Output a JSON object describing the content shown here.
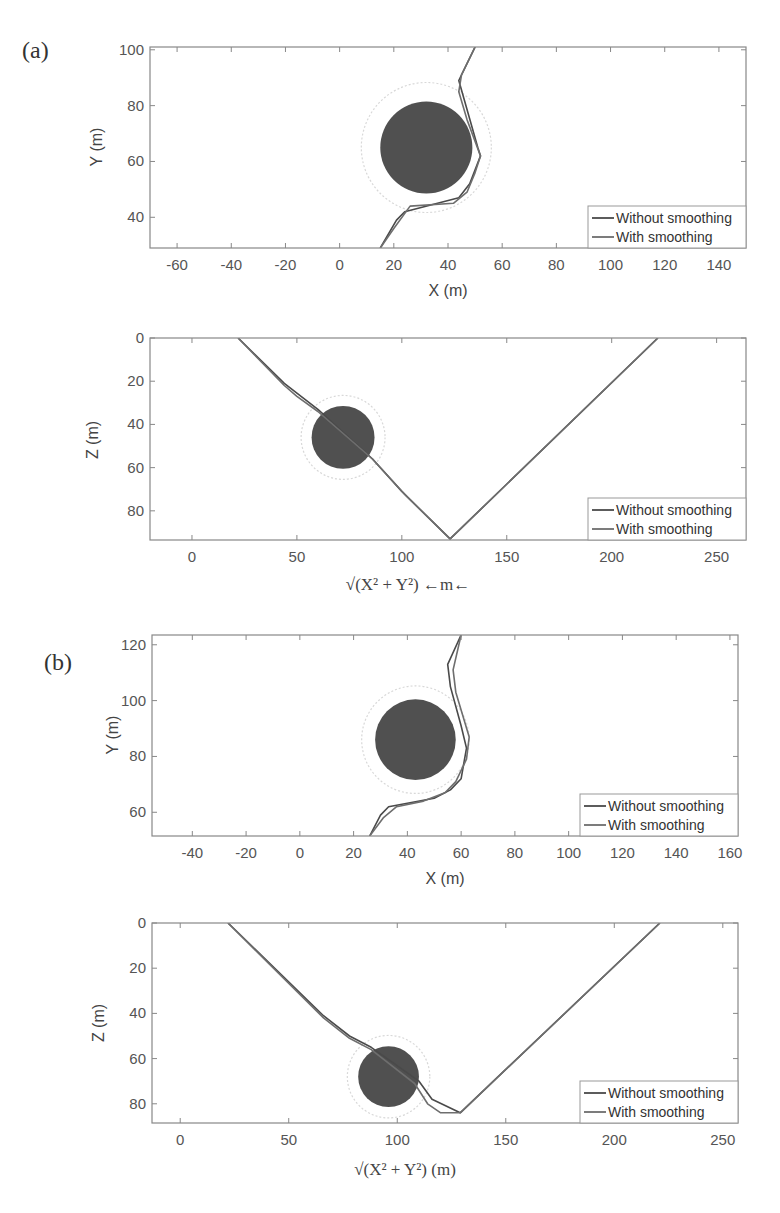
{
  "figure": {
    "panels": [
      {
        "label": "(a)"
      },
      {
        "label": "(b)"
      }
    ]
  },
  "colors": {
    "without_smoothing": "#4a4a4a",
    "with_smoothing": "#6e6e6e",
    "obstacle": "#505050",
    "safety_ring": "#d8d8d8"
  },
  "chart_data": [
    {
      "id": "a-top",
      "type": "line",
      "panel": "(a)",
      "xlabel": "X (m)",
      "ylabel": "Y (m)",
      "xlim": [
        -70,
        150
      ],
      "ylim": [
        29,
        101
      ],
      "xticks": [
        -60,
        -40,
        -20,
        0,
        20,
        40,
        60,
        80,
        100,
        120,
        140
      ],
      "yticks": [
        40,
        60,
        80,
        100
      ],
      "y_inverted": false,
      "legend": {
        "position": "bottom-right",
        "entries": [
          "Without smoothing",
          "With smoothing"
        ]
      },
      "obstacle": {
        "center": [
          32,
          65
        ],
        "radius": 17,
        "safety_radius": 24
      },
      "series": [
        {
          "name": "Without smoothing",
          "points": [
            [
              15,
              29
            ],
            [
              21,
              39
            ],
            [
              24,
              42
            ],
            [
              44,
              47
            ],
            [
              48,
              52
            ],
            [
              52,
              62
            ],
            [
              51,
              65
            ],
            [
              44,
              89
            ],
            [
              50,
              101
            ]
          ]
        },
        {
          "name": "With smoothing",
          "points": [
            [
              15,
              29
            ],
            [
              20,
              36
            ],
            [
              26,
              44
            ],
            [
              42,
              45
            ],
            [
              47,
              49
            ],
            [
              50,
              56
            ],
            [
              52,
              62
            ],
            [
              47,
              75
            ],
            [
              44,
              85
            ],
            [
              45,
              91
            ],
            [
              50,
              101
            ]
          ]
        }
      ]
    },
    {
      "id": "a-bottom",
      "type": "line",
      "panel": "(a)",
      "xlabel": "√(X² + Y²) ←m←",
      "ylabel": "Z (m)",
      "xlim": [
        -20,
        264
      ],
      "ylim": [
        0,
        93.5
      ],
      "xticks": [
        0,
        50,
        100,
        150,
        200,
        250
      ],
      "yticks": [
        0,
        20,
        40,
        60,
        80
      ],
      "y_inverted": true,
      "legend": {
        "position": "bottom-right",
        "entries": [
          "Without smoothing",
          "With smoothing"
        ]
      },
      "obstacle": {
        "center": [
          72,
          46
        ],
        "radius": 15,
        "safety_radius": 20
      },
      "series": [
        {
          "name": "Without smoothing",
          "points": [
            [
              22,
              0
            ],
            [
              44,
              21
            ],
            [
              48,
              24
            ],
            [
              60,
              33
            ],
            [
              86,
              56
            ],
            [
              100,
              71
            ],
            [
              123,
              93
            ],
            [
              222,
              0
            ]
          ]
        },
        {
          "name": "With smoothing",
          "points": [
            [
              22,
              0
            ],
            [
              44,
              22
            ],
            [
              50,
              27
            ],
            [
              60,
              34
            ],
            [
              86,
              56
            ],
            [
              102,
              73
            ],
            [
              123,
              93
            ],
            [
              222,
              0
            ]
          ]
        }
      ]
    },
    {
      "id": "b-top",
      "type": "line",
      "panel": "(b)",
      "xlabel": "X (m)",
      "ylabel": "Y (m)",
      "xlim": [
        -55,
        163
      ],
      "ylim": [
        51.5,
        123.5
      ],
      "xticks": [
        -40,
        -20,
        0,
        20,
        40,
        60,
        80,
        100,
        120,
        140,
        160
      ],
      "yticks": [
        60,
        80,
        100,
        120
      ],
      "y_inverted": false,
      "legend": {
        "position": "bottom-right",
        "entries": [
          "Without smoothing",
          "With smoothing"
        ]
      },
      "obstacle": {
        "center": [
          43,
          86
        ],
        "radius": 15,
        "safety_radius": 20
      },
      "series": [
        {
          "name": "Without smoothing",
          "points": [
            [
              26,
              51.5
            ],
            [
              30,
              59
            ],
            [
              33,
              62
            ],
            [
              50,
              65
            ],
            [
              56,
              68
            ],
            [
              60,
              72
            ],
            [
              62,
              83
            ],
            [
              60,
              91
            ],
            [
              56,
              105
            ],
            [
              55,
              113
            ],
            [
              60,
              123.5
            ]
          ]
        },
        {
          "name": "With smoothing",
          "points": [
            [
              26,
              51.5
            ],
            [
              31,
              58
            ],
            [
              36,
              62
            ],
            [
              46,
              64
            ],
            [
              54,
              67
            ],
            [
              58,
              71
            ],
            [
              62,
              79
            ],
            [
              63,
              87
            ],
            [
              58,
              103
            ],
            [
              57,
              111
            ],
            [
              60,
              123.5
            ]
          ]
        }
      ]
    },
    {
      "id": "b-bottom",
      "type": "line",
      "panel": "(b)",
      "xlabel": "√(X² + Y²) (m)",
      "ylabel": "Z (m)",
      "xlim": [
        -13,
        257
      ],
      "ylim": [
        0,
        88.5
      ],
      "xticks": [
        0,
        50,
        100,
        150,
        200,
        250
      ],
      "yticks": [
        0,
        20,
        40,
        60,
        80
      ],
      "y_inverted": true,
      "legend": {
        "position": "bottom-right",
        "entries": [
          "Without smoothing",
          "With smoothing"
        ]
      },
      "obstacle": {
        "center": [
          96,
          68
        ],
        "radius": 14,
        "safety_radius": 19
      },
      "series": [
        {
          "name": "Without smoothing",
          "points": [
            [
              22,
              0
            ],
            [
              66,
              41
            ],
            [
              78,
              50
            ],
            [
              88,
              55
            ],
            [
              110,
              70
            ],
            [
              116,
              78
            ],
            [
              129,
              84
            ],
            [
              221,
              0
            ]
          ]
        },
        {
          "name": "With smoothing",
          "points": [
            [
              22,
              0
            ],
            [
              66,
              42
            ],
            [
              78,
              51
            ],
            [
              88,
              56
            ],
            [
              108,
              71
            ],
            [
              114,
              80
            ],
            [
              120,
              84
            ],
            [
              129,
              84
            ],
            [
              221,
              0
            ]
          ]
        }
      ]
    }
  ]
}
